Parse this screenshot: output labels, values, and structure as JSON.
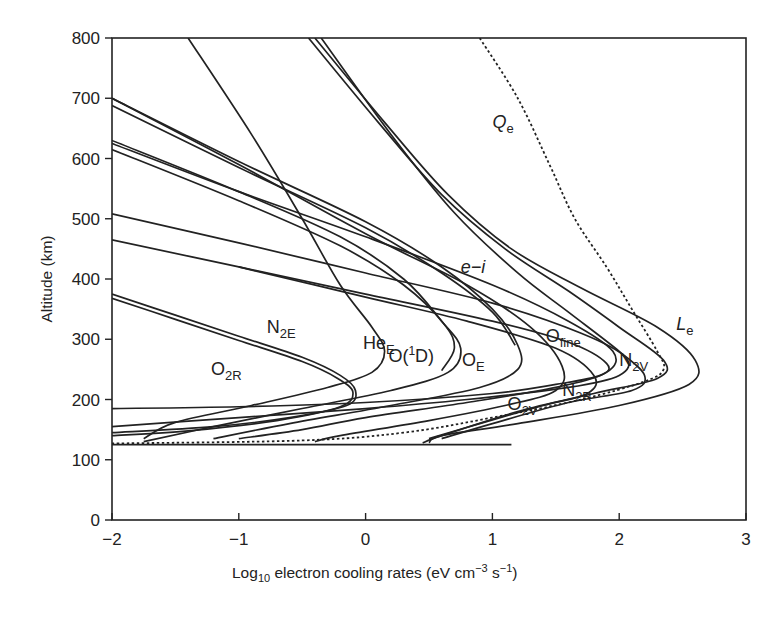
{
  "chart_data": {
    "type": "line",
    "title": "",
    "xlabel": "Log10 electron cooling rates (eV cm-3 s-1)",
    "xlabel_parts": {
      "main": "Log",
      "sub": "10",
      "rest": " electron cooling rates  (eV cm",
      "sup1": "−3",
      "mid": " s",
      "sup2": "−1",
      "end": ")"
    },
    "ylabel": "Altitude (km)",
    "xlim": [
      -2,
      3
    ],
    "ylim": [
      0,
      800
    ],
    "xticks": [
      -2,
      -1,
      0,
      1,
      2,
      3
    ],
    "xtick_labels": [
      "−2",
      "−1",
      "0",
      "1",
      "2",
      "3"
    ],
    "yticks": [
      0,
      100,
      200,
      300,
      400,
      500,
      600,
      700,
      800
    ],
    "ytick_labels": [
      "0",
      "100",
      "200",
      "300",
      "400",
      "500",
      "600",
      "700",
      "800"
    ],
    "grid": false,
    "legend": "none (inline labels)",
    "series": [
      {
        "name": "O2R",
        "style": "solid",
        "points": [
          [
            -2,
            375
          ],
          [
            -1.5,
            340
          ],
          [
            -1,
            305
          ],
          [
            -0.5,
            270
          ],
          [
            -0.2,
            240
          ],
          [
            -0.08,
            215
          ],
          [
            -0.15,
            190
          ],
          [
            -0.6,
            170
          ],
          [
            -1.2,
            155
          ],
          [
            -2,
            145
          ]
        ]
      },
      {
        "name": "O2R-b",
        "style": "solid",
        "points": [
          [
            -2,
            368
          ],
          [
            -1.5,
            333
          ],
          [
            -1,
            298
          ],
          [
            -0.5,
            263
          ],
          [
            -0.22,
            235
          ],
          [
            -0.1,
            212
          ],
          [
            -0.2,
            188
          ],
          [
            -0.7,
            165
          ],
          [
            -1.4,
            148
          ],
          [
            -2,
            140
          ]
        ]
      },
      {
        "name": "N2E",
        "style": "solid",
        "points": [
          [
            -2,
            465
          ],
          [
            -1,
            420
          ],
          [
            0,
            375
          ],
          [
            1,
            330
          ],
          [
            1.6,
            295
          ],
          [
            1.9,
            260
          ],
          [
            1.85,
            240
          ],
          [
            1.5,
            225
          ],
          [
            1,
            210
          ],
          [
            0,
            195
          ],
          [
            -1,
            188
          ],
          [
            -2,
            185
          ]
        ]
      },
      {
        "name": "N2E-b",
        "style": "solid",
        "points": [
          [
            -2,
            508
          ],
          [
            -1,
            460
          ],
          [
            0,
            410
          ],
          [
            1,
            360
          ],
          [
            1.7,
            310
          ],
          [
            2.05,
            270
          ],
          [
            2.0,
            240
          ],
          [
            1.6,
            220
          ],
          [
            0.8,
            200
          ],
          [
            0,
            185
          ],
          [
            -1,
            170
          ],
          [
            -2,
            155
          ]
        ]
      },
      {
        "name": "HeE",
        "style": "solid",
        "points": [
          [
            -1.4,
            800
          ],
          [
            -0.9,
            640
          ],
          [
            -0.5,
            500
          ],
          [
            -0.2,
            390
          ],
          [
            0.05,
            320
          ],
          [
            0.15,
            280
          ],
          [
            0.05,
            245
          ],
          [
            -0.3,
            220
          ],
          [
            -0.9,
            190
          ],
          [
            -1.5,
            162
          ],
          [
            -1.75,
            135
          ]
        ]
      },
      {
        "name": "O1D",
        "style": "solid",
        "points": [
          [
            -2,
            630
          ],
          [
            -1,
            545
          ],
          [
            -0.2,
            470
          ],
          [
            0.3,
            400
          ],
          [
            0.6,
            330
          ],
          [
            0.75,
            285
          ],
          [
            0.65,
            245
          ],
          [
            0.2,
            215
          ],
          [
            -0.5,
            185
          ],
          [
            -1.2,
            155
          ],
          [
            -1.75,
            130
          ]
        ]
      },
      {
        "name": "O1D-b",
        "style": "solid",
        "points": [
          [
            -2,
            615
          ],
          [
            -1,
            530
          ],
          [
            -0.2,
            455
          ],
          [
            0.3,
            390
          ],
          [
            0.62,
            325
          ],
          [
            0.7,
            285
          ],
          [
            0.6,
            248
          ]
        ]
      },
      {
        "name": "OE",
        "style": "solid",
        "points": [
          [
            -2,
            700
          ],
          [
            -1,
            595
          ],
          [
            0,
            495
          ],
          [
            0.6,
            420
          ],
          [
            1.0,
            350
          ],
          [
            1.2,
            290
          ],
          [
            1.2,
            250
          ],
          [
            0.9,
            220
          ],
          [
            0.2,
            190
          ],
          [
            -0.6,
            160
          ],
          [
            -1.2,
            135
          ]
        ]
      },
      {
        "name": "OE-b",
        "style": "solid",
        "points": [
          [
            -2,
            688
          ],
          [
            -1,
            585
          ],
          [
            0,
            485
          ],
          [
            0.6,
            410
          ],
          [
            1.0,
            345
          ],
          [
            1.18,
            290
          ]
        ]
      },
      {
        "name": "Ofine",
        "style": "solid",
        "points": [
          [
            -2,
            625
          ],
          [
            -1,
            545
          ],
          [
            0,
            470
          ],
          [
            1,
            390
          ],
          [
            1.6,
            330
          ],
          [
            1.95,
            280
          ],
          [
            1.9,
            245
          ],
          [
            1.5,
            220
          ],
          [
            0.8,
            195
          ],
          [
            0,
            170
          ],
          [
            -0.5,
            150
          ],
          [
            -1,
            135
          ]
        ]
      },
      {
        "name": "O2V",
        "style": "solid",
        "points": [
          [
            -2,
            700
          ],
          [
            -1,
            590
          ],
          [
            0,
            475
          ],
          [
            0.8,
            390
          ],
          [
            1.3,
            320
          ],
          [
            1.55,
            255
          ],
          [
            1.5,
            215
          ],
          [
            1.1,
            190
          ],
          [
            0.5,
            165
          ],
          [
            -0.2,
            140
          ],
          [
            -0.4,
            130
          ]
        ]
      },
      {
        "name": "N2R",
        "style": "solid",
        "points": [
          [
            -1,
            420
          ],
          [
            0,
            370
          ],
          [
            0.8,
            330
          ],
          [
            1.5,
            285
          ],
          [
            1.8,
            240
          ],
          [
            1.75,
            210
          ],
          [
            1.4,
            190
          ],
          [
            0.9,
            160
          ],
          [
            0.5,
            135
          ]
        ]
      },
      {
        "name": "N2V",
        "style": "solid",
        "points": [
          [
            -0.35,
            800
          ],
          [
            0.2,
            640
          ],
          [
            0.7,
            510
          ],
          [
            1.2,
            410
          ],
          [
            1.6,
            345
          ],
          [
            2.0,
            280
          ],
          [
            2.2,
            240
          ],
          [
            2.1,
            215
          ],
          [
            1.6,
            195
          ],
          [
            1.0,
            160
          ],
          [
            0.6,
            135
          ]
        ]
      },
      {
        "name": "e-i",
        "style": "solid",
        "points": [
          [
            -0.45,
            800
          ],
          [
            0.1,
            660
          ],
          [
            0.6,
            540
          ],
          [
            1.1,
            450
          ],
          [
            1.6,
            380
          ],
          [
            2.0,
            320
          ],
          [
            2.35,
            265
          ],
          [
            2.3,
            235
          ],
          [
            1.8,
            210
          ],
          [
            1.2,
            180
          ],
          [
            0.6,
            140
          ],
          [
            0.45,
            128
          ]
        ]
      },
      {
        "name": "Le",
        "style": "solid",
        "points": [
          [
            -0.4,
            800
          ],
          [
            0.15,
            660
          ],
          [
            0.65,
            540
          ],
          [
            1.15,
            450
          ],
          [
            1.7,
            385
          ],
          [
            2.3,
            320
          ],
          [
            2.6,
            265
          ],
          [
            2.55,
            225
          ],
          [
            2.0,
            190
          ],
          [
            1.2,
            160
          ],
          [
            0.6,
            140
          ],
          [
            0.5,
            128
          ]
        ]
      },
      {
        "name": "Qe",
        "style": "dotted",
        "points": [
          [
            0.9,
            800
          ],
          [
            1.2,
            700
          ],
          [
            1.45,
            590
          ],
          [
            1.65,
            500
          ],
          [
            1.9,
            420
          ],
          [
            2.1,
            350
          ],
          [
            2.3,
            280
          ],
          [
            2.35,
            250
          ],
          [
            2.2,
            230
          ],
          [
            1.7,
            200
          ],
          [
            1.0,
            170
          ],
          [
            0.3,
            145
          ],
          [
            -0.5,
            132
          ],
          [
            -2,
            127
          ]
        ]
      },
      {
        "name": "baseline",
        "style": "solid",
        "points": [
          [
            -2,
            125
          ],
          [
            1.15,
            125
          ]
        ]
      }
    ],
    "labels": [
      {
        "id": "Qe",
        "text": "Q",
        "sub": "e",
        "x": 1.0,
        "y": 650,
        "italic": true
      },
      {
        "id": "e-i",
        "text": "e−i",
        "sub": "",
        "x": 0.75,
        "y": 410,
        "italic": true
      },
      {
        "id": "Le",
        "text": "L",
        "sub": "e",
        "x": 2.45,
        "y": 315,
        "italic": true
      },
      {
        "id": "N2E",
        "text": "N",
        "sub": "2E",
        "x": -0.78,
        "y": 310,
        "italic": false
      },
      {
        "id": "HeE",
        "text": "He",
        "sub": "E",
        "x": -0.02,
        "y": 283,
        "italic": false
      },
      {
        "id": "O1D",
        "text": "O(",
        "sup": "1",
        "rest": "D)",
        "x": 0.18,
        "y": 262,
        "italic": false
      },
      {
        "id": "OE",
        "text": "O",
        "sub": "E",
        "x": 0.76,
        "y": 255,
        "italic": false
      },
      {
        "id": "Ofine",
        "text": "O",
        "sub": "fine",
        "x": 1.42,
        "y": 295,
        "italic": false
      },
      {
        "id": "O2R",
        "text": "O",
        "sub": "2R",
        "x": -1.22,
        "y": 240,
        "italic": false
      },
      {
        "id": "O2V",
        "text": "O",
        "sub": "2V",
        "x": 1.12,
        "y": 182,
        "italic": false
      },
      {
        "id": "N2R",
        "text": "N",
        "sub": "2R",
        "x": 1.55,
        "y": 205,
        "italic": false
      },
      {
        "id": "N2V",
        "text": "N",
        "sub": "2V",
        "x": 2.0,
        "y": 255,
        "italic": false
      }
    ]
  }
}
